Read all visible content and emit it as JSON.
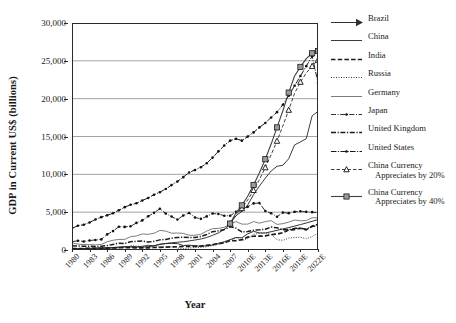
{
  "chart_data": {
    "type": "line",
    "title": "",
    "xlabel": "Year",
    "ylabel": "GDP in Current US$ (billions)",
    "ylim": [
      0,
      30000
    ],
    "ytick_values": [
      0,
      5000,
      10000,
      15000,
      20000,
      25000,
      30000
    ],
    "ytick_labels": [
      "0",
      "5,000",
      "10,000",
      "15,000",
      "20,000",
      "25,000",
      "30,000"
    ],
    "grid": "horizontal",
    "legend_position": "right",
    "x": [
      1980,
      1981,
      1982,
      1983,
      1984,
      1985,
      1986,
      1987,
      1988,
      1989,
      1990,
      1991,
      1992,
      1993,
      1994,
      1995,
      1996,
      1997,
      1998,
      1999,
      2000,
      2001,
      2002,
      2003,
      2004,
      2005,
      2006,
      2007,
      2008,
      2009,
      2010,
      2011,
      2012,
      2013,
      2014,
      2015,
      2016,
      2017,
      2018,
      2019,
      2020,
      2021,
      2022
    ],
    "tick_labels": [
      "1980",
      "1983",
      "1986",
      "1989",
      "1992",
      "1995",
      "1998",
      "2001",
      "2004",
      "2007",
      "2010E",
      "2013E",
      "2016E",
      "2019E",
      "2022E"
    ],
    "tick_years": [
      1980,
      1983,
      1986,
      1989,
      1992,
      1995,
      1998,
      2001,
      2004,
      2007,
      2010,
      2013,
      2016,
      2019,
      2022
    ],
    "series": [
      {
        "name": "Brazil",
        "style": "solid-arrow",
        "values": [
          150,
          170,
          180,
          160,
          150,
          190,
          240,
          270,
          300,
          400,
          460,
          400,
          380,
          430,
          540,
          770,
          840,
          870,
          840,
          590,
          640,
          550,
          500,
          550,
          660,
          880,
          1090,
          1370,
          1650,
          1620,
          2140,
          2470,
          2250,
          2240,
          2420,
          2600,
          2780,
          2960,
          3160,
          3360,
          3570,
          3790,
          4020
        ]
      },
      {
        "name": "China",
        "style": "thin-solid",
        "values": [
          190,
          190,
          200,
          230,
          260,
          310,
          300,
          320,
          410,
          450,
          390,
          410,
          490,
          620,
          560,
          730,
          860,
          960,
          1020,
          1090,
          1200,
          1320,
          1450,
          1650,
          1940,
          2260,
          2710,
          3490,
          4520,
          5110,
          5950,
          7320,
          8460,
          9490,
          10440,
          11060,
          11200,
          12060,
          13890,
          14280,
          14720,
          17730,
          18320
        ]
      },
      {
        "name": "India",
        "style": "thick-dash",
        "values": [
          190,
          200,
          200,
          220,
          210,
          230,
          250,
          280,
          300,
          300,
          320,
          270,
          290,
          280,
          330,
          360,
          390,
          420,
          430,
          460,
          480,
          490,
          520,
          620,
          720,
          830,
          950,
          1240,
          1220,
          1370,
          1710,
          1820,
          1830,
          1860,
          2040,
          2100,
          2290,
          2650,
          2700,
          2870,
          2660,
          3150,
          3380
        ]
      },
      {
        "name": "Russia",
        "style": "dotted",
        "values": [
          null,
          null,
          null,
          null,
          null,
          null,
          null,
          null,
          null,
          null,
          570,
          510,
          460,
          440,
          400,
          400,
          390,
          400,
          270,
          200,
          260,
          310,
          350,
          430,
          590,
          760,
          990,
          1300,
          1660,
          1220,
          1520,
          2050,
          2210,
          2290,
          2060,
          1360,
          1280,
          1570,
          1660,
          1690,
          1480,
          1780,
          2240
        ]
      },
      {
        "name": "Germany",
        "style": "thin-solid-gray",
        "values": [
          950,
          780,
          720,
          720,
          680,
          730,
          1090,
          1290,
          1400,
          1400,
          1760,
          1860,
          2120,
          2070,
          2210,
          2590,
          2500,
          2220,
          2240,
          2200,
          1950,
          1950,
          2080,
          2500,
          2820,
          2860,
          3000,
          3440,
          3750,
          3420,
          3420,
          3760,
          3540,
          3750,
          3890,
          3380,
          3480,
          3690,
          3960,
          3860,
          3890,
          4260,
          4270
        ]
      },
      {
        "name": "Japan",
        "style": "dash-dot-marker",
        "values": [
          1100,
          1220,
          1130,
          1250,
          1330,
          1400,
          2060,
          2500,
          3070,
          3050,
          3130,
          3580,
          3910,
          4450,
          4910,
          5450,
          4830,
          4420,
          4030,
          4560,
          4890,
          4300,
          4120,
          4440,
          4820,
          4760,
          4530,
          4520,
          5040,
          5230,
          5700,
          6160,
          6200,
          5160,
          4850,
          4390,
          4940,
          4870,
          5040,
          5120,
          5040,
          5000,
          4940
        ]
      },
      {
        "name": "United Kingdom",
        "style": "thick-dash-dot",
        "values": [
          560,
          540,
          510,
          490,
          460,
          490,
          580,
          740,
          900,
          870,
          1090,
          1140,
          1180,
          1060,
          1140,
          1340,
          1400,
          1560,
          1650,
          1690,
          1660,
          1640,
          1790,
          2050,
          2420,
          2540,
          2710,
          3080,
          2890,
          2380,
          2440,
          2620,
          2660,
          2740,
          3030,
          2930,
          2690,
          2670,
          2860,
          2880,
          2760,
          3120,
          3200
        ]
      },
      {
        "name": "United States",
        "style": "solid-dot-dash",
        "values": [
          2860,
          3210,
          3340,
          3630,
          4040,
          4340,
          4580,
          4860,
          5250,
          5660,
          5980,
          6170,
          6540,
          6880,
          7310,
          7640,
          8070,
          8580,
          9060,
          9630,
          10250,
          10580,
          10940,
          11460,
          12210,
          13040,
          13810,
          14450,
          14710,
          14450,
          14990,
          15540,
          16200,
          16790,
          17520,
          18220,
          19200,
          20400,
          21700,
          23000,
          24300,
          25600,
          22100
        ]
      },
      {
        "name": "China Currency Appreciates by 20%",
        "style": "dash-triangle",
        "values": [
          null,
          null,
          null,
          null,
          null,
          null,
          null,
          null,
          null,
          null,
          null,
          null,
          null,
          null,
          null,
          null,
          null,
          null,
          null,
          null,
          null,
          null,
          null,
          null,
          null,
          null,
          null,
          3490,
          4700,
          5500,
          6600,
          7900,
          9300,
          10900,
          12600,
          14400,
          16400,
          18500,
          20700,
          22200,
          23400,
          24300,
          25100
        ]
      },
      {
        "name": "China Currency Appreciates by 40%",
        "style": "solid-square",
        "values": [
          null,
          null,
          null,
          null,
          null,
          null,
          null,
          null,
          null,
          null,
          null,
          null,
          null,
          null,
          null,
          null,
          null,
          null,
          null,
          null,
          null,
          null,
          null,
          null,
          null,
          null,
          null,
          3490,
          4900,
          5900,
          7100,
          8600,
          10200,
          12000,
          14000,
          16200,
          18400,
          20800,
          23000,
          24200,
          25300,
          26000,
          26300
        ]
      }
    ]
  },
  "legend": {
    "items": [
      {
        "label": "Brazil",
        "label2": "",
        "style": "solid-arrow"
      },
      {
        "label": "China",
        "label2": "",
        "style": "thin-solid"
      },
      {
        "label": "India",
        "label2": "",
        "style": "thick-dash"
      },
      {
        "label": "Russia",
        "label2": "",
        "style": "dotted"
      },
      {
        "label": "Germany",
        "label2": "",
        "style": "thin-solid-gray"
      },
      {
        "label": "Japan",
        "label2": "",
        "style": "dash-dot-marker"
      },
      {
        "label": "United Kingdom",
        "label2": "",
        "style": "thick-dash-dot"
      },
      {
        "label": "United States",
        "label2": "",
        "style": "solid-dot-dash"
      },
      {
        "label": "China Currency",
        "label2": "Appreciates by 20%",
        "style": "dash-triangle"
      },
      {
        "label": "China Currency",
        "label2": "Appreciates by 40%",
        "style": "solid-square"
      }
    ]
  }
}
